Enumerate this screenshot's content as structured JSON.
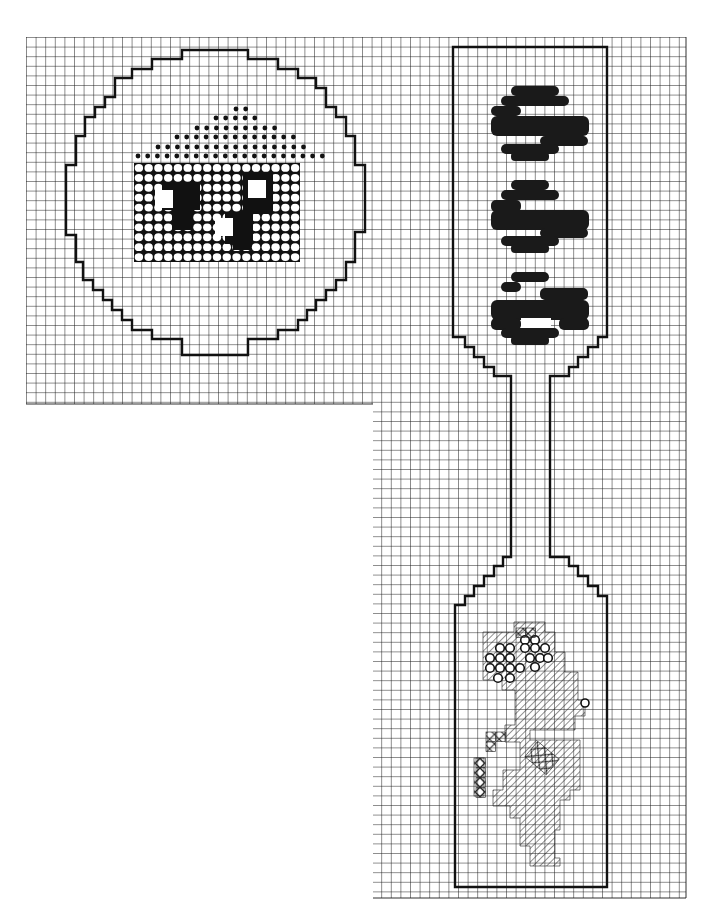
{
  "colors": {
    "background": "#ffffff",
    "grid": "#1a1a1a",
    "outline": "#111111",
    "dark_stitch": "#1a1a1a"
  },
  "grid": {
    "origin_x": 26,
    "origin_y": 37,
    "cell": 9.6,
    "upper_block": {
      "x0": 26,
      "y0": 37,
      "x1": 686,
      "y1": 404
    },
    "lower_column": {
      "x0": 373,
      "y0": 404,
      "x1": 686,
      "y1": 898
    }
  },
  "legend": {
    "symbols": [
      {
        "name": "dark-filled-circle",
        "meaning": "dark stitch"
      },
      {
        "name": "open-circle",
        "meaning": "light stitch on dark ground"
      },
      {
        "name": "small-dot",
        "meaning": "dotted stitch"
      },
      {
        "name": "diagonal-hatch",
        "meaning": "half-cross stitch"
      },
      {
        "name": "cross-hatch",
        "meaning": "cross stitch"
      }
    ]
  },
  "panels": [
    {
      "id": "round-ornament",
      "label": "Round ornament",
      "outline": [
        [
          182,
          50
        ],
        [
          248,
          50
        ],
        [
          248,
          59
        ],
        [
          278,
          59
        ],
        [
          278,
          69
        ],
        [
          298,
          69
        ],
        [
          298,
          78
        ],
        [
          316,
          78
        ],
        [
          316,
          88
        ],
        [
          326,
          88
        ],
        [
          326,
          107
        ],
        [
          336,
          107
        ],
        [
          336,
          117
        ],
        [
          346,
          117
        ],
        [
          346,
          136
        ],
        [
          355,
          136
        ],
        [
          355,
          165
        ],
        [
          365,
          165
        ],
        [
          365,
          232
        ],
        [
          355,
          232
        ],
        [
          355,
          262
        ],
        [
          346,
          262
        ],
        [
          346,
          280
        ],
        [
          336,
          280
        ],
        [
          336,
          290
        ],
        [
          326,
          290
        ],
        [
          326,
          300
        ],
        [
          316,
          300
        ],
        [
          316,
          310
        ],
        [
          307,
          310
        ],
        [
          307,
          320
        ],
        [
          298,
          320
        ],
        [
          298,
          330
        ],
        [
          278,
          330
        ],
        [
          278,
          339
        ],
        [
          248,
          339
        ],
        [
          248,
          355
        ],
        [
          182,
          355
        ],
        [
          182,
          339
        ],
        [
          152,
          339
        ],
        [
          152,
          330
        ],
        [
          132,
          330
        ],
        [
          132,
          320
        ],
        [
          122,
          320
        ],
        [
          122,
          310
        ],
        [
          112,
          310
        ],
        [
          112,
          300
        ],
        [
          103,
          300
        ],
        [
          103,
          290
        ],
        [
          93,
          290
        ],
        [
          93,
          280
        ],
        [
          83,
          280
        ],
        [
          83,
          262
        ],
        [
          76,
          262
        ],
        [
          76,
          235
        ],
        [
          66,
          235
        ],
        [
          66,
          165
        ],
        [
          76,
          165
        ],
        [
          76,
          136
        ],
        [
          85,
          136
        ],
        [
          85,
          117
        ],
        [
          95,
          117
        ],
        [
          95,
          107
        ],
        [
          105,
          107
        ],
        [
          105,
          97
        ],
        [
          115,
          97
        ],
        [
          115,
          78
        ],
        [
          132,
          78
        ],
        [
          132,
          69
        ],
        [
          152,
          69
        ],
        [
          152,
          59
        ],
        [
          182,
          59
        ]
      ],
      "motif": "house with dotted roof",
      "roof_rows": [
        {
          "y": 109,
          "x_from": 236,
          "count": 2
        },
        {
          "y": 118,
          "x_from": 216,
          "count": 5
        },
        {
          "y": 128,
          "x_from": 197,
          "count": 9
        },
        {
          "y": 137,
          "x_from": 177,
          "count": 13
        },
        {
          "y": 147,
          "x_from": 158,
          "count": 16
        },
        {
          "y": 156,
          "x_from": 138,
          "count": 20
        }
      ],
      "house_body": {
        "x0": 134,
        "y0": 163,
        "x1": 300,
        "y1": 262,
        "cols": 17,
        "rows": 10
      },
      "dark_regions": [
        {
          "x": 162,
          "y": 182,
          "w": 38,
          "h": 28
        },
        {
          "x": 172,
          "y": 190,
          "w": 20,
          "h": 40
        },
        {
          "x": 243,
          "y": 174,
          "w": 30,
          "h": 40
        },
        {
          "x": 225,
          "y": 212,
          "w": 28,
          "h": 32
        },
        {
          "x": 233,
          "y": 230,
          "w": 18,
          "h": 20
        }
      ],
      "windows": [
        {
          "x": 155,
          "y": 190,
          "w": 18,
          "h": 18
        },
        {
          "x": 248,
          "y": 180,
          "w": 18,
          "h": 18
        },
        {
          "x": 215,
          "y": 218,
          "w": 18,
          "h": 18
        }
      ]
    },
    {
      "id": "bookmark",
      "label": "Bookmark",
      "outline": [
        [
          453,
          47
        ],
        [
          607,
          47
        ],
        [
          607,
          337
        ],
        [
          598,
          337
        ],
        [
          598,
          347
        ],
        [
          588,
          347
        ],
        [
          588,
          357
        ],
        [
          578,
          357
        ],
        [
          578,
          367
        ],
        [
          569,
          367
        ],
        [
          569,
          376
        ],
        [
          550,
          376
        ],
        [
          550,
          378
        ],
        [
          550,
          557
        ],
        [
          569,
          557
        ],
        [
          569,
          566
        ],
        [
          578,
          566
        ],
        [
          578,
          576
        ],
        [
          588,
          576
        ],
        [
          588,
          586
        ],
        [
          598,
          586
        ],
        [
          598,
          596
        ],
        [
          607,
          596
        ],
        [
          607,
          605
        ],
        [
          607,
          887
        ],
        [
          455,
          887
        ],
        [
          455,
          605
        ],
        [
          465,
          605
        ],
        [
          465,
          596
        ],
        [
          474,
          596
        ],
        [
          474,
          586
        ],
        [
          484,
          586
        ],
        [
          484,
          576
        ],
        [
          494,
          576
        ],
        [
          494,
          566
        ],
        [
          503,
          566
        ],
        [
          503,
          557
        ],
        [
          511,
          557
        ],
        [
          511,
          378
        ],
        [
          511,
          376
        ],
        [
          494,
          376
        ],
        [
          494,
          367
        ],
        [
          484,
          367
        ],
        [
          484,
          357
        ],
        [
          474,
          357
        ],
        [
          474,
          347
        ],
        [
          465,
          347
        ],
        [
          465,
          337
        ],
        [
          453,
          337
        ]
      ],
      "letters": [
        {
          "glyph": "S",
          "rotated": true,
          "y_top": 85,
          "y_bottom": 160
        },
        {
          "glyph": "S",
          "rotated": true,
          "y_top": 178,
          "y_bottom": 252
        },
        {
          "glyph": "a",
          "rotated": true,
          "y_top": 270,
          "y_bottom": 346
        }
      ],
      "motif": "flowers in vase (hatched)",
      "flower_circles": [
        [
          500,
          648
        ],
        [
          510,
          648
        ],
        [
          490,
          658
        ],
        [
          500,
          658
        ],
        [
          510,
          658
        ],
        [
          490,
          668
        ],
        [
          500,
          668
        ],
        [
          510,
          668
        ],
        [
          520,
          668
        ],
        [
          498,
          678
        ],
        [
          510,
          678
        ],
        [
          525,
          640
        ],
        [
          535,
          640
        ],
        [
          525,
          648
        ],
        [
          535,
          648
        ],
        [
          545,
          648
        ],
        [
          530,
          658
        ],
        [
          540,
          658
        ],
        [
          548,
          658
        ],
        [
          535,
          667
        ]
      ],
      "cross_cells": [
        [
          516,
          628
        ],
        [
          526,
          628
        ],
        [
          486,
          732
        ],
        [
          496,
          732
        ],
        [
          486,
          742
        ],
        [
          476,
          758
        ],
        [
          476,
          768
        ],
        [
          476,
          778
        ],
        [
          476,
          788
        ]
      ]
    }
  ]
}
